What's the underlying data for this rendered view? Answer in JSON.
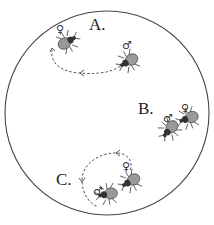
{
  "figure": {
    "arena": {
      "shape": "circle",
      "cx": 107,
      "cy": 113,
      "r": 102
    },
    "panels": [
      {
        "label": "A.",
        "description": "male follows female; dashed path curving back",
        "insects": [
          {
            "sex": "female",
            "symbol": "♀"
          },
          {
            "sex": "male",
            "symbol": "♂"
          }
        ]
      },
      {
        "label": "B.",
        "description": "male and female side by side",
        "insects": [
          {
            "sex": "male",
            "symbol": "♂"
          },
          {
            "sex": "female",
            "symbol": "♀"
          }
        ]
      },
      {
        "label": "C.",
        "description": "circling dashed path around pair",
        "insects": [
          {
            "sex": "female",
            "symbol": "♀"
          },
          {
            "sex": "male",
            "symbol": "♂"
          }
        ]
      }
    ]
  }
}
